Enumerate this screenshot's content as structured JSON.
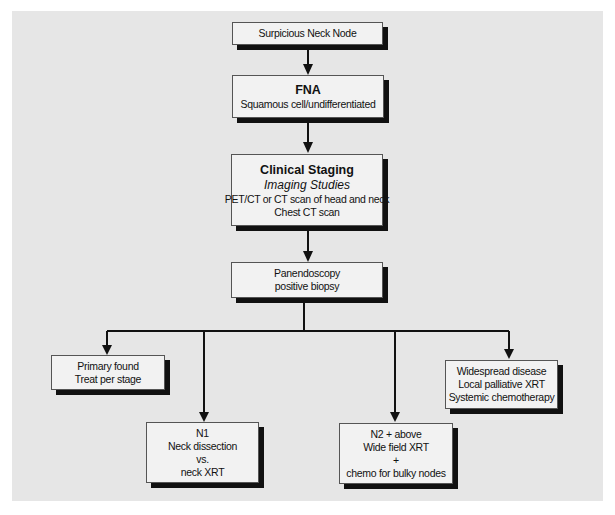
{
  "flowchart": {
    "nodes": {
      "suspicious": {
        "lines": [
          "Surpicious Neck Node"
        ]
      },
      "fna": {
        "title": "FNA",
        "lines": [
          "Squamous cell/undifferentiated"
        ]
      },
      "staging": {
        "title": "Clinical Staging",
        "subtitle": "Imaging Studies",
        "lines": [
          "PET/CT or CT scan of head and neck",
          "Chest CT scan"
        ]
      },
      "panendoscopy": {
        "lines": [
          "Panendoscopy",
          "positive biopsy"
        ]
      },
      "primary": {
        "lines": [
          "Primary found",
          "Treat per stage"
        ]
      },
      "n1": {
        "lines": [
          "N1",
          "Neck dissection",
          "vs.",
          "neck XRT"
        ]
      },
      "n2": {
        "lines": [
          "N2 + above",
          "Wide field XRT",
          "+",
          "chemo for bulky nodes"
        ]
      },
      "widespread": {
        "lines": [
          "Widespread disease",
          "Local palliative XRT",
          "Systemic chemotherapy"
        ]
      }
    },
    "edges": [
      [
        "suspicious",
        "fna"
      ],
      [
        "fna",
        "staging"
      ],
      [
        "staging",
        "panendoscopy"
      ],
      [
        "panendoscopy",
        "primary"
      ],
      [
        "panendoscopy",
        "n1"
      ],
      [
        "panendoscopy",
        "n2"
      ],
      [
        "panendoscopy",
        "widespread"
      ]
    ]
  }
}
